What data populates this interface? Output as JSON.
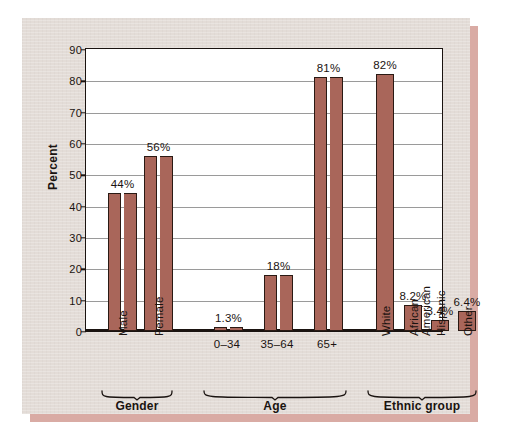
{
  "chart_data": {
    "type": "bar",
    "title": "",
    "subtitle": "",
    "xlabel": "",
    "ylabel": "Percent",
    "ylim": [
      0,
      90
    ],
    "yticks": [
      0,
      10,
      20,
      30,
      40,
      50,
      60,
      70,
      80,
      90
    ],
    "grid": true,
    "legend": "none",
    "value_label_suffix": "%",
    "bar_color": "#a9665a",
    "bar_edge_color": "#2a1a14",
    "plot_background": "#ffffff",
    "panel_background": "#e3dcd7",
    "shadow_color": "#d9aba4",
    "gridline_color": "#9a9a9a",
    "axis_color": "#1a1310",
    "groups": [
      {
        "name": "Gender",
        "categories": [
          "Male",
          "Female"
        ],
        "label_orientation": "vertical",
        "values": [
          44,
          56
        ],
        "value_labels": [
          "44%",
          "56%"
        ]
      },
      {
        "name": "Age",
        "categories": [
          "0–34",
          "35–64",
          "65+"
        ],
        "label_orientation": "horizontal",
        "values": [
          1.3,
          18,
          81
        ],
        "value_labels": [
          "1.3%",
          "18%",
          "81%"
        ]
      },
      {
        "name": "Ethnic group",
        "categories": [
          "White",
          "African\nAmerican",
          "Hispanic",
          "Other"
        ],
        "label_orientation": "vertical",
        "values": [
          82,
          8.2,
          3.4,
          6.4
        ],
        "value_labels": [
          "82%",
          "8.2%",
          "3.4%",
          "6.4%"
        ]
      }
    ],
    "categories": [
      "Male",
      "Female",
      "0–34",
      "35–64",
      "65+",
      "White",
      "African American",
      "Hispanic",
      "Other"
    ],
    "values": [
      44,
      56,
      1.3,
      18,
      81,
      82,
      8.2,
      3.4,
      6.4
    ]
  },
  "axis": {
    "y_label": "Percent",
    "y_ticks": [
      "90",
      "80",
      "70",
      "60",
      "50",
      "40",
      "30",
      "20",
      "10",
      "0"
    ]
  },
  "bars": [
    {
      "key": "male",
      "label": "Male",
      "value_label": "44%",
      "value": 44
    },
    {
      "key": "female",
      "label": "Female",
      "value_label": "56%",
      "value": 56
    },
    {
      "key": "age-0-34",
      "label": "0–34",
      "value_label": "1.3%",
      "value": 1.3
    },
    {
      "key": "age-35-64",
      "label": "35–64",
      "value_label": "18%",
      "value": 18
    },
    {
      "key": "age-65plus",
      "label": "65+",
      "value_label": "81%",
      "value": 81
    },
    {
      "key": "white",
      "label": "White",
      "value_label": "82%",
      "value": 82
    },
    {
      "key": "african-american-1",
      "label": "African",
      "value_label": "8.2%",
      "value": 8.2
    },
    {
      "key": "african-american-2",
      "label": "American",
      "value_label": "",
      "value": 8.2
    },
    {
      "key": "hispanic",
      "label": "Hispanic",
      "value_label": "3.4%",
      "value": 3.4
    },
    {
      "key": "other",
      "label": "Other",
      "value_label": "6.4%",
      "value": 6.4
    }
  ],
  "groups": [
    {
      "key": "gender",
      "name": "Gender"
    },
    {
      "key": "age",
      "name": "Age"
    },
    {
      "key": "ethnic-group",
      "name": "Ethnic group"
    }
  ]
}
